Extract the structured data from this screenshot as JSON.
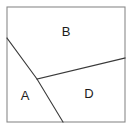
{
  "figure": {
    "background_color": "#ffffff",
    "outline_color": "#8a8a8a",
    "line_color": "#3a3a3a",
    "label_color": "#1c1c1c",
    "square": {
      "left": 7,
      "top": 7,
      "right": 125,
      "bottom": 122
    },
    "labels": [
      {
        "text": "B",
        "x": 66,
        "y": 33,
        "region": "upper"
      },
      {
        "text": "A",
        "x": 25,
        "y": 97,
        "region": "lower-left"
      },
      {
        "text": "D",
        "x": 89,
        "y": 95,
        "region": "lower-right"
      }
    ],
    "lines": [
      {
        "name": "diagonal-divider",
        "points": "7,38 37,79 63,122",
        "from": "left-edge",
        "to": "bottom-edge"
      },
      {
        "name": "oblique-divider",
        "points": "37,79 125,58",
        "from": "interior-vertex",
        "to": "right-edge"
      }
    ],
    "vertices": {
      "left_edge_point": "7,38",
      "interior_junction": "37,79",
      "bottom_edge_point": "63,122",
      "right_edge_point": "125,58"
    }
  },
  "chart_data": {
    "type": "diagram",
    "shape": "square",
    "regions": [
      {
        "label": "B",
        "polygon": [
          [
            7,
            7
          ],
          [
            125,
            7
          ],
          [
            125,
            58
          ],
          [
            37,
            79
          ],
          [
            7,
            38
          ]
        ],
        "label_position": [
          66,
          33
        ]
      },
      {
        "label": "A",
        "polygon": [
          [
            7,
            38
          ],
          [
            37,
            79
          ],
          [
            63,
            122
          ],
          [
            7,
            122
          ]
        ],
        "label_position": [
          25,
          97
        ]
      },
      {
        "label": "D",
        "polygon": [
          [
            37,
            79
          ],
          [
            125,
            58
          ],
          [
            125,
            122
          ],
          [
            63,
            122
          ]
        ],
        "label_position": [
          89,
          95
        ]
      }
    ],
    "xlim": [
      0,
      133
    ],
    "ylim": [
      0,
      132
    ],
    "grid": false,
    "legend": false
  }
}
